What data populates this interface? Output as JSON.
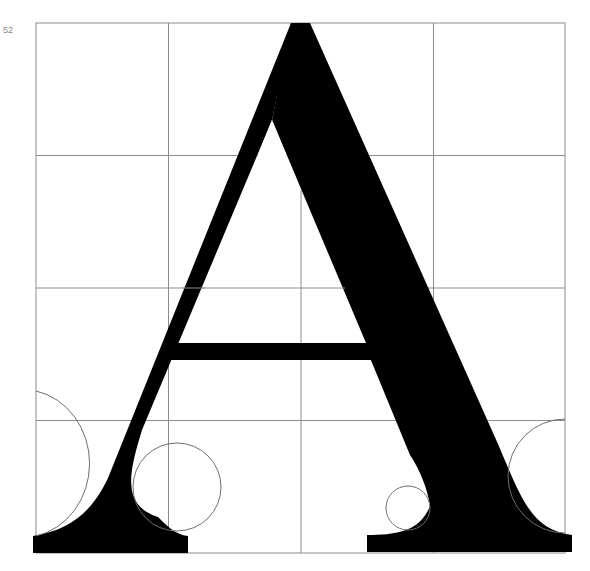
{
  "page": {
    "number": "52"
  },
  "figure": {
    "glyph": "A",
    "grid": {
      "columns": 4,
      "rows": 4,
      "line_color": "#8c8c8c"
    },
    "glyph_color": "#000000",
    "construction_circles_color": "#6e6e6e"
  }
}
